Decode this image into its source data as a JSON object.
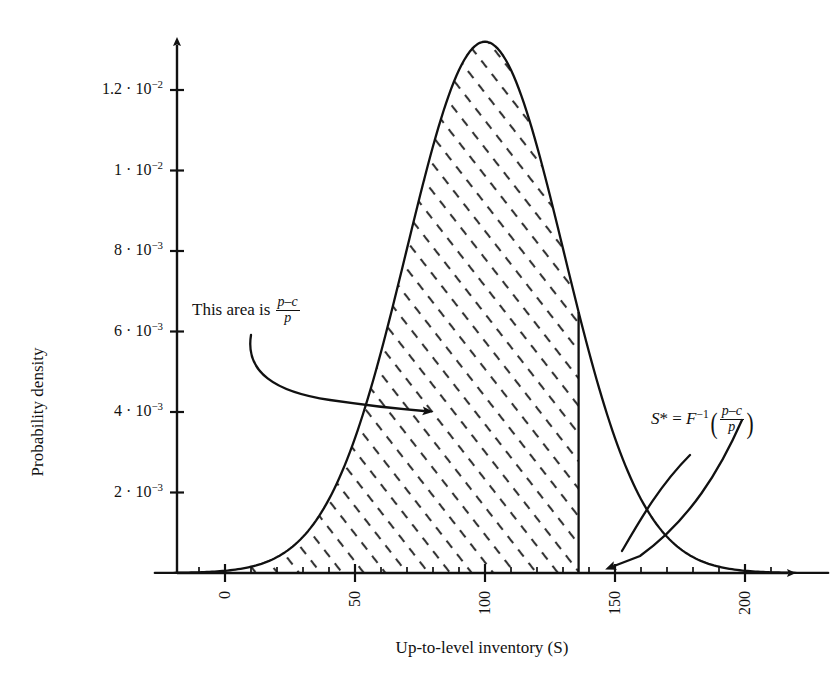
{
  "chart_data": {
    "type": "area",
    "title": "",
    "xlabel": "Up-to-level inventory (S)",
    "ylabel": "Probability density",
    "xlim": [
      -27,
      232
    ],
    "ylim": [
      0,
      0.01423
    ],
    "grid": false,
    "legend": "none",
    "distribution": {
      "name": "normal-density",
      "mean": 100,
      "std": 30.2,
      "peak_value": 0.0132,
      "peak_x": 100
    },
    "x": [
      -20,
      -10,
      0,
      10,
      20,
      30,
      40,
      50,
      60,
      70,
      80,
      90,
      100,
      110,
      120,
      130,
      136,
      140,
      150,
      160,
      170,
      180,
      190,
      200,
      210,
      220
    ],
    "y": [
      1.1e-06,
      5.5e-06,
      2.34e-05,
      8.52e-05,
      0.0002648,
      0.0007031,
      0.0015953,
      0.0030903,
      0.0051088,
      0.0072144,
      0.0086974,
      0.0089521,
      0.0131991,
      0.0119515,
      0.0086974,
      0.0053998,
      0.0038842,
      0.0028614,
      0.001293,
      0.000498,
      0.0001639,
      4.61e-05,
      1.11e-05,
      2.3e-06,
      4e-07,
      1e-07
    ],
    "shaded_region": {
      "label": "This area is (p-c)/p",
      "x_from": -27,
      "x_to": 136,
      "hatch": "diagonal-dashes"
    },
    "cut_line_x": 136,
    "xticks": [
      {
        "value": 0,
        "label": "0"
      },
      {
        "value": 50,
        "label": "50"
      },
      {
        "value": 100,
        "label": "100"
      },
      {
        "value": 150,
        "label": "150"
      },
      {
        "value": 200,
        "label": "200"
      }
    ],
    "xtick_minor_step": 10,
    "yticks": [
      {
        "value": 0.002,
        "mantissa": "2",
        "exponent": "-3",
        "label": "2 · 10⁻³"
      },
      {
        "value": 0.004,
        "mantissa": "4",
        "exponent": "-3",
        "label": "4 · 10⁻³"
      },
      {
        "value": 0.006,
        "mantissa": "6",
        "exponent": "-3",
        "label": "6 · 10⁻³"
      },
      {
        "value": 0.008,
        "mantissa": "8",
        "exponent": "-3",
        "label": "8 · 10⁻³"
      },
      {
        "value": 0.01,
        "mantissa": "1",
        "exponent": "-2",
        "label": "1 · 10⁻²"
      },
      {
        "value": 0.012,
        "mantissa": "1.2",
        "exponent": "-2",
        "label": "1.2 · 10⁻²"
      }
    ],
    "annotations": [
      {
        "name": "area-annotation",
        "text_prefix": "This area is ",
        "fraction_numerator": "p–c",
        "fraction_denominator": "p",
        "arrow": "curved-arrow-to-shaded-area"
      },
      {
        "name": "sstar-annotation",
        "text_prefix": "S",
        "star": "*",
        "equals": " = ",
        "function": "F",
        "exponent": "−1",
        "fraction_numerator": "p–c",
        "fraction_denominator": "p",
        "arrow": "curved-arrow-to-cut-line"
      }
    ],
    "colors": {
      "axis": "#111111",
      "curve": "#111111",
      "hatch": "#333333",
      "background": "#ffffff"
    }
  }
}
